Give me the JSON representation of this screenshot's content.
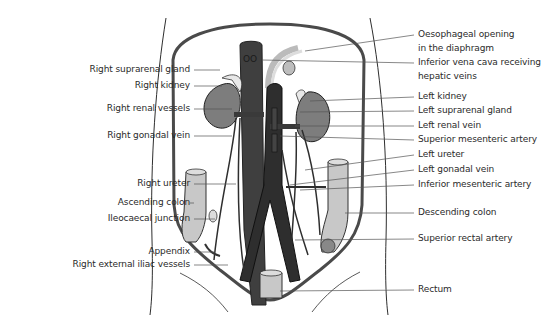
{
  "figure": {
    "colors": {
      "outline": "#2e2e2e",
      "vessel_dark": "#3a3a3a",
      "aorta": "#4a4a4a",
      "kidney": "#7d7d7d",
      "colon": "#c8c8c8",
      "leader": "#555555",
      "text": "#2a2a2a"
    }
  },
  "labels_left": [
    {
      "text": "Right suprarenal gland",
      "x": 198,
      "y": 70,
      "target_x": 220
    },
    {
      "text": "Right kidney",
      "x": 198,
      "y": 86,
      "target_x": 222
    },
    {
      "text": "Right renal vessels",
      "x": 198,
      "y": 109,
      "target_x": 232
    },
    {
      "text": "Right gonadal vein",
      "x": 198,
      "y": 136,
      "target_x": 232
    },
    {
      "text": "Right ureter",
      "x": 198,
      "y": 184,
      "target_x": 236
    },
    {
      "text": "Ascending colon",
      "x": 198,
      "y": 203,
      "target_x": 190
    },
    {
      "text": "Ileocaecal junction",
      "x": 198,
      "y": 219,
      "target_x": 215
    },
    {
      "text": "Appendix",
      "x": 198,
      "y": 252,
      "target_x": 215
    },
    {
      "text": "Right external iliac vessels",
      "x": 198,
      "y": 265,
      "target_x": 228
    }
  ],
  "labels_right": [
    {
      "lines": [
        "Oesophageal opening",
        "in the diaphragm"
      ],
      "x": 418,
      "y": 35,
      "target_x": 305,
      "target_y": 51
    },
    {
      "lines": [
        "Inferior vena cava receiving",
        "hepatic veins"
      ],
      "x": 418,
      "y": 63,
      "target_x": 262,
      "target_y": 60
    },
    {
      "lines": [
        "Left kidney"
      ],
      "x": 418,
      "y": 97,
      "target_x": 310,
      "target_y": 101
    },
    {
      "lines": [
        "Left suprarenal gland"
      ],
      "x": 418,
      "y": 111,
      "target_x": 300,
      "target_y": 112
    },
    {
      "lines": [
        "Left renal vein"
      ],
      "x": 418,
      "y": 126,
      "target_x": 295,
      "target_y": 126
    },
    {
      "lines": [
        "Superior mesenteric artery"
      ],
      "x": 418,
      "y": 140,
      "target_x": 280,
      "target_y": 136
    },
    {
      "lines": [
        "Left ureter"
      ],
      "x": 418,
      "y": 155,
      "target_x": 305,
      "target_y": 170
    },
    {
      "lines": [
        "Left gonadal vein"
      ],
      "x": 418,
      "y": 170,
      "target_x": 290,
      "target_y": 185
    },
    {
      "lines": [
        "Inferior mesenteric artery"
      ],
      "x": 418,
      "y": 185,
      "target_x": 300,
      "target_y": 190
    },
    {
      "lines": [
        "Descending colon"
      ],
      "x": 418,
      "y": 213,
      "target_x": 345,
      "target_y": 213
    },
    {
      "lines": [
        "Superior rectal artery"
      ],
      "x": 418,
      "y": 239,
      "target_x": 295,
      "target_y": 240
    },
    {
      "lines": [
        "Rectum"
      ],
      "x": 418,
      "y": 290,
      "target_x": 280,
      "target_y": 291
    }
  ]
}
